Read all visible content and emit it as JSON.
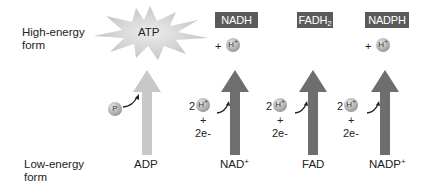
{
  "rows": {
    "high": {
      "line1": "High-energy",
      "line2": "form"
    },
    "low": {
      "line1": "Low-energy",
      "line2": "form"
    }
  },
  "carriers": [
    {
      "id": "atp",
      "high_form": "ATP",
      "low_form": "ADP",
      "input": "P",
      "arrow_color": "#c8c8c8"
    },
    {
      "id": "nadh",
      "high_form": "NADH",
      "low_form_base": "NAD",
      "low_form_sup": "+",
      "input_coef": "2",
      "input_ion": "H",
      "input_ion_sup": "+",
      "plus": "+",
      "electrons": "2e-",
      "released": "H",
      "released_sup": "+",
      "arrow_color": "#6e6e6e"
    },
    {
      "id": "fadh2",
      "high_form_base": "FADH",
      "high_form_sub": "2",
      "low_form": "FAD",
      "input_coef": "2",
      "input_ion": "H",
      "input_ion_sup": "+",
      "plus": "+",
      "electrons": "2e-",
      "arrow_color": "#6e6e6e"
    },
    {
      "id": "nadph",
      "high_form": "NADPH",
      "low_form_base": "NADP",
      "low_form_sup": "+",
      "input_coef": "2",
      "input_ion": "H",
      "input_ion_sup": "+",
      "plus": "+",
      "electrons": "2e-",
      "released": "H",
      "released_sup": "+",
      "arrow_color": "#6e6e6e"
    }
  ],
  "plus_sign": "+"
}
